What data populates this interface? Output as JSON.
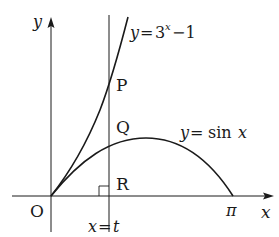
{
  "diagram": {
    "axes": {
      "x_label": "x",
      "y_label": "y",
      "origin_label": "O"
    },
    "curves": [
      {
        "name": "exponential",
        "label_lhs": "y",
        "label_eq": "=",
        "label_rhs_base": "3",
        "label_rhs_exp": "x",
        "label_rhs_tail": "−1"
      },
      {
        "name": "sine",
        "label_lhs": "y",
        "label_eq": "=",
        "label_rhs": "sin",
        "label_var": "x"
      }
    ],
    "vertical_line": {
      "label_lhs": "x",
      "label_eq": "=",
      "label_rhs": "t"
    },
    "points": {
      "P": "P",
      "Q": "Q",
      "R": "R"
    },
    "x_ticks": {
      "pi": "π"
    },
    "colors": {
      "stroke": "#1a1a1a",
      "background": "#ffffff"
    }
  }
}
